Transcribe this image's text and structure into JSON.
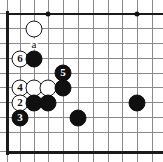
{
  "figure": {
    "kind": "go-board-diagram",
    "board": {
      "visible_columns": 10,
      "visible_rows": 10,
      "line_color": "#8a8a8a",
      "edge_color": "#1a1a1a",
      "background_color": "#ffffff",
      "origin_x": 20,
      "origin_y": 29,
      "spacing": 14.75,
      "edges": {
        "left": true,
        "top": true,
        "bottom": true,
        "right": false
      }
    },
    "star_points": [
      {
        "name": "hoshi-top-left",
        "x": 48,
        "y": 14
      },
      {
        "name": "hoshi-top-right",
        "x": 137,
        "y": 14
      }
    ],
    "stones": [
      {
        "id": "w-top",
        "color": "white",
        "label": "",
        "x": 34,
        "y": 29
      },
      {
        "id": "w-6",
        "color": "white",
        "label": "6",
        "x": 20,
        "y": 59
      },
      {
        "id": "b-c3",
        "color": "black",
        "label": "",
        "x": 34,
        "y": 59
      },
      {
        "id": "b-5",
        "color": "black",
        "label": "5",
        "x": 63,
        "y": 73
      },
      {
        "id": "w-4",
        "color": "white",
        "label": "4",
        "x": 20,
        "y": 88
      },
      {
        "id": "w-r4-c2",
        "color": "white",
        "label": "",
        "x": 34,
        "y": 88
      },
      {
        "id": "w-r4-c3",
        "color": "white",
        "label": "",
        "x": 48,
        "y": 88
      },
      {
        "id": "b-r4-c4",
        "color": "black",
        "label": "",
        "x": 63,
        "y": 88
      },
      {
        "id": "w-2",
        "color": "white",
        "label": "2",
        "x": 20,
        "y": 103
      },
      {
        "id": "b-r5-c2",
        "color": "black",
        "label": "",
        "x": 34,
        "y": 103
      },
      {
        "id": "b-r5-c3",
        "color": "black",
        "label": "",
        "x": 48,
        "y": 103
      },
      {
        "id": "b-right",
        "color": "black",
        "label": "",
        "x": 137,
        "y": 103
      },
      {
        "id": "b-3",
        "color": "black",
        "label": "3",
        "x": 20,
        "y": 118
      },
      {
        "id": "b-r6-c5",
        "color": "black",
        "label": "",
        "x": 78,
        "y": 118
      }
    ],
    "markers": [
      {
        "id": "point-a",
        "label": "a",
        "x": 34,
        "y": 44
      }
    ],
    "move_numbers": [
      "2",
      "3",
      "4",
      "5",
      "6"
    ],
    "letters": [
      "a"
    ]
  }
}
